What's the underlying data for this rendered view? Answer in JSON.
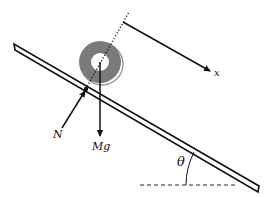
{
  "diagram": {
    "labels": {
      "axis_x": "x",
      "normal_force": "N",
      "weight": "Mg",
      "angle": "θ"
    },
    "colors": {
      "ink": "#111111",
      "ring": "#7a7a7a",
      "ring_shadow": "#9a9a9a",
      "plank_fill": "#ffffff",
      "background": "#ffffff"
    }
  }
}
